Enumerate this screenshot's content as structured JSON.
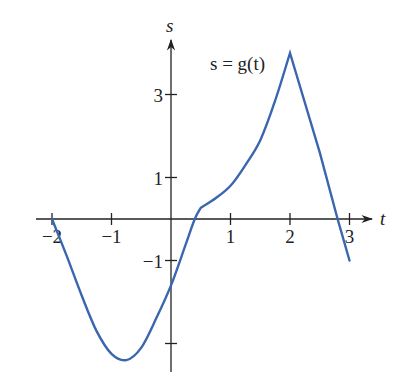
{
  "chart_data": {
    "type": "line",
    "title": "",
    "xlabel": "t",
    "ylabel": "s",
    "curve_label": "s = g(t)",
    "xlim": [
      -2.3,
      3.6
    ],
    "ylim": [
      -3.8,
      4.4
    ],
    "x_ticks": [
      -2,
      -1,
      1,
      2,
      3
    ],
    "x_tick_labels": [
      "−2",
      "−1",
      "1",
      "2",
      "3"
    ],
    "y_ticks": [
      3,
      1,
      -1,
      -3
    ],
    "y_tick_labels": [
      "3",
      "1",
      "−1",
      ""
    ],
    "grid": false,
    "legend": "none",
    "series": [
      {
        "name": "s = g(t)",
        "color": "#3a66b0",
        "x": [
          -2.0,
          -1.75,
          -1.5,
          -1.25,
          -1.0,
          -0.75,
          -0.5,
          -0.25,
          0.0,
          0.25,
          0.4,
          0.5,
          0.75,
          1.0,
          1.25,
          1.5,
          1.75,
          2.0,
          2.5,
          2.8,
          3.0
        ],
        "y": [
          0.0,
          -0.9,
          -1.85,
          -2.7,
          -3.25,
          -3.4,
          -3.1,
          -2.4,
          -1.6,
          -0.6,
          0.0,
          0.27,
          0.5,
          0.8,
          1.3,
          1.9,
          2.85,
          4.0,
          1.6,
          0.0,
          -1.0
        ]
      }
    ],
    "annotations": [
      {
        "text": "s = g(t)",
        "x": 1.25,
        "y": 3.9
      }
    ]
  },
  "labels": {
    "x_axis": "t",
    "y_axis": "s",
    "curve": "s = g(t)",
    "x_ticks": [
      "−2",
      "−1",
      "1",
      "2",
      "3"
    ],
    "y_ticks": [
      "3",
      "1",
      "−1"
    ]
  },
  "colors": {
    "curve": "#3a66b0",
    "axis": "#222222"
  }
}
